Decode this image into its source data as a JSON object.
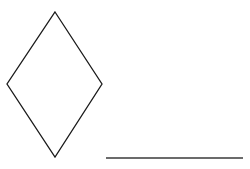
{
  "diagram": {
    "background": "#ffffff",
    "shapes": [
      {
        "id": "diamond",
        "type": "diamond",
        "points": "55,12 102,84 55,157 7,84",
        "stroke": "#1a1a1a",
        "stroke_width": 1.3,
        "fill": "none"
      },
      {
        "id": "line",
        "type": "line",
        "x1": 106,
        "y1": 158,
        "x2": 243,
        "y2": 158,
        "stroke": "#3a3a3a",
        "stroke_width": 1.6
      }
    ]
  }
}
